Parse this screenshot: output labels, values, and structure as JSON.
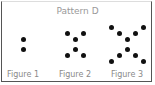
{
  "title": "Pattern D",
  "figures": [
    {
      "label": "Figure 1",
      "dots": [
        [
          23,
          39
        ],
        [
          23,
          49
        ]
      ]
    },
    {
      "label": "Figure 2",
      "dots": [
        [
          67,
          33
        ],
        [
          83,
          33
        ],
        [
          75,
          39
        ],
        [
          75,
          49
        ],
        [
          67,
          55
        ],
        [
          83,
          55
        ]
      ]
    },
    {
      "label": "Figure 3",
      "dots": [
        [
          111,
          27
        ],
        [
          143,
          27
        ],
        [
          119,
          33
        ],
        [
          135,
          33
        ],
        [
          127,
          39
        ],
        [
          127,
          49
        ],
        [
          119,
          55
        ],
        [
          135,
          55
        ],
        [
          111,
          61
        ],
        [
          143,
          61
        ]
      ]
    }
  ]
}
